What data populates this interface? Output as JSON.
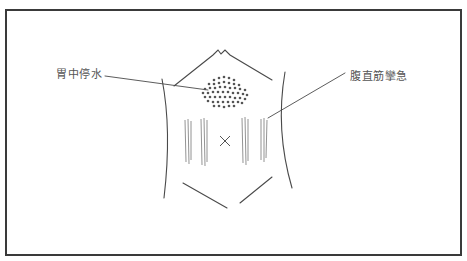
{
  "figure": {
    "labels": {
      "stomach_water": "胃中停水",
      "rectus_spasm": "腹直筋攣急"
    },
    "center_mark": "X",
    "colors": {
      "frame": "#3a3a3a",
      "line": "#4a4a4a",
      "text": "#555555",
      "background": "#ffffff"
    }
  }
}
